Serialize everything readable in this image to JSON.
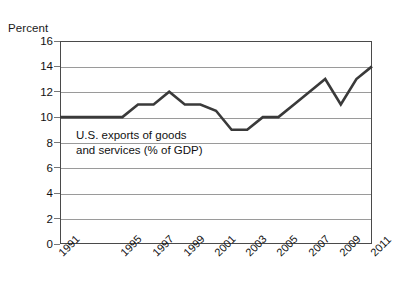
{
  "chart_data": {
    "type": "line",
    "title": "",
    "xlabel": "",
    "ylabel": "Percent",
    "annotation": {
      "line1": "U.S. exports of goods",
      "line2": "and services (% of GDP)"
    },
    "series_name": "U.S. exports of goods and services (% of GDP)",
    "x": [
      1991,
      1992,
      1993,
      1994,
      1995,
      1996,
      1997,
      1998,
      1999,
      2000,
      2001,
      2002,
      2003,
      2004,
      2005,
      2006,
      2007,
      2008,
      2009,
      2010,
      2011
    ],
    "values": [
      10,
      10,
      10,
      10,
      10,
      11,
      11,
      12,
      11,
      11,
      10.5,
      9,
      9,
      10,
      10,
      11,
      12,
      13,
      11,
      13,
      14
    ],
    "xtick_labels": [
      "1991",
      "1995",
      "1997",
      "1999",
      "2001",
      "2003",
      "2005",
      "2007",
      "2009",
      "2011"
    ],
    "xtick_values": [
      1991,
      1995,
      1997,
      1999,
      2001,
      2003,
      2005,
      2007,
      2009,
      2011
    ],
    "ytick_labels": [
      "16",
      "14",
      "12",
      "10",
      "8",
      "6",
      "4",
      "2",
      "0"
    ],
    "ytick_values": [
      16,
      14,
      12,
      10,
      8,
      6,
      4,
      2,
      0
    ],
    "xlim": [
      1991,
      2011
    ],
    "ylim": [
      0,
      16
    ],
    "grid": "horizontal",
    "legend": "none",
    "line_color": "#3a3a3a",
    "grid_color": "#9a9a9a",
    "frame_color": "#4a4a4a",
    "background": "#ffffff"
  }
}
